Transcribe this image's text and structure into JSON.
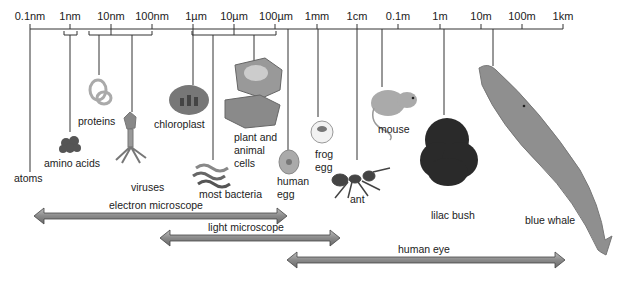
{
  "scale": {
    "ticks": [
      {
        "label": "0.1nm",
        "x": 30
      },
      {
        "label": "1nm",
        "x": 70
      },
      {
        "label": "10nm",
        "x": 111
      },
      {
        "label": "100nm",
        "x": 152
      },
      {
        "label": "1µm",
        "x": 193
      },
      {
        "label": "10µm",
        "x": 234
      },
      {
        "label": "100µm",
        "x": 275
      },
      {
        "label": "1mm",
        "x": 317
      },
      {
        "label": "1cm",
        "x": 357
      },
      {
        "label": "0.1m",
        "x": 398
      },
      {
        "label": "1m",
        "x": 440
      },
      {
        "label": "10m",
        "x": 481
      },
      {
        "label": "100m",
        "x": 522
      },
      {
        "label": "1km",
        "x": 563
      }
    ]
  },
  "items": {
    "atoms": "atoms",
    "amino_acids": "amino acids",
    "proteins": "proteins",
    "viruses": "viruses",
    "chloroplast": "chloroplast",
    "most_bacteria": "most bacteria",
    "plant_animal_cells_1": "plant and",
    "plant_animal_cells_2": "animal",
    "plant_animal_cells_3": "cells",
    "human_egg_1": "human",
    "human_egg_2": "egg",
    "frog_egg_1": "frog",
    "frog_egg_2": "egg",
    "ant": "ant",
    "mouse": "mouse",
    "lilac_bush": "lilac bush",
    "blue_whale": "blue whale"
  },
  "ranges": {
    "electron_microscope": "electron microscope",
    "light_microscope": "light microscope",
    "human_eye": "human eye"
  },
  "colors": {
    "arrow_fill": "#8a8a8a",
    "arrow_stroke": "#444444",
    "line": "#333333"
  }
}
